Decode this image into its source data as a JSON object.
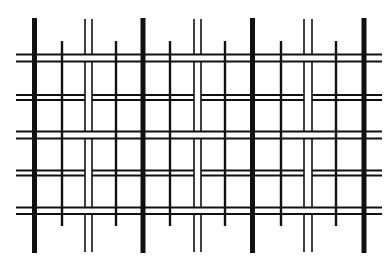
{
  "diagram": {
    "type": "line-grid-pattern",
    "background": "#ffffff",
    "stroke_color": "#111111",
    "canvas": {
      "width": 391,
      "height": 269
    },
    "thick_verticals": {
      "x": [
        34.5,
        143,
        252.5,
        364
      ],
      "y1": 18,
      "y2": 253,
      "width": 5
    },
    "double_verticals": {
      "pairs": [
        [
          85,
          92
        ],
        [
          194,
          201
        ],
        [
          304,
          312
        ]
      ],
      "y1": 19,
      "y2": 252,
      "width": 1.6
    },
    "tick_verticals": {
      "x": [
        62,
        116,
        170,
        225,
        281,
        336
      ],
      "y1": 41,
      "y2": 226,
      "width": 2.4
    },
    "horizontal_pairs": [
      {
        "y": [
          54.5,
          61.5
        ],
        "continuous": true
      },
      {
        "y": [
          95,
          100
        ],
        "continuous": false
      },
      {
        "y": [
          131.5,
          138.5
        ],
        "continuous": true
      },
      {
        "y": [
          170.5,
          175.5
        ],
        "continuous": false
      },
      {
        "y": [
          207.5,
          214
        ],
        "continuous": true
      }
    ],
    "horizontal_extent": {
      "x1": 16,
      "x2": 382,
      "width": 1.8
    }
  }
}
